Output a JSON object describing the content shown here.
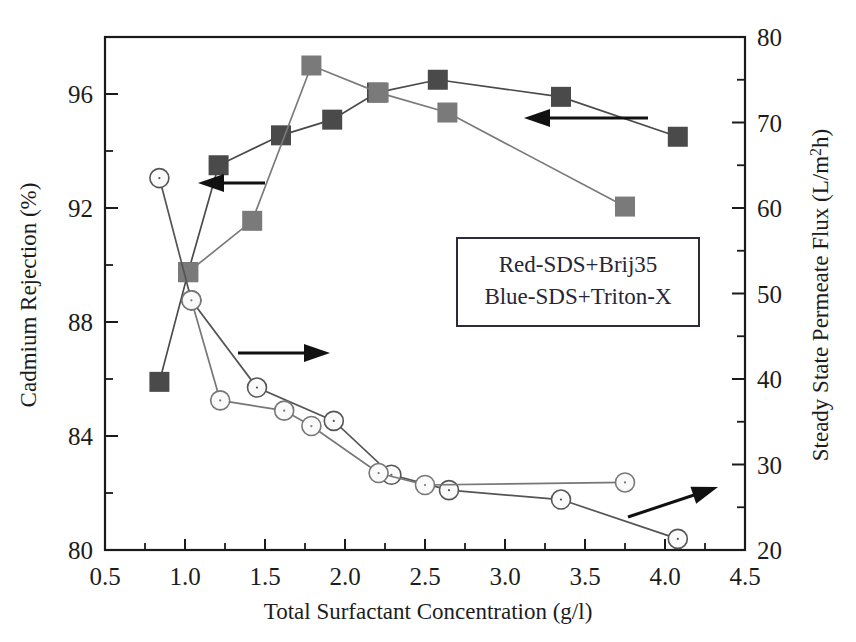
{
  "chart_data": {
    "type": "line",
    "title": "",
    "xlabel": "Total Surfactant Concentration (g/l)",
    "ylabel": "Cadmium Rejection (%)",
    "ylabel_right": "Steady State Permeate Flux (L/m²h)",
    "xlim": [
      0.5,
      4.5
    ],
    "ylim": [
      80,
      98
    ],
    "ylim_right": [
      20,
      80
    ],
    "xticks": [
      "0.5",
      "1.0",
      "1.5",
      "2.0",
      "2.5",
      "3.0",
      "3.5",
      "4.0",
      "4.5"
    ],
    "xtick_values": [
      0.5,
      1.0,
      1.5,
      2.0,
      2.5,
      3.0,
      3.5,
      4.0,
      4.5
    ],
    "yticks": [
      "80",
      "84",
      "88",
      "92",
      "96"
    ],
    "ytick_values": [
      80,
      84,
      88,
      92,
      96
    ],
    "yticks_right": [
      "20",
      "30",
      "40",
      "50",
      "60",
      "70",
      "80"
    ],
    "ytick_right_values": [
      20,
      30,
      40,
      50,
      60,
      70,
      80
    ],
    "grid": false,
    "legend_position": "center-right",
    "legend_entries": [
      "Red-SDS+Brij35",
      "Blue-SDS+Triton-X"
    ],
    "colors": {
      "red_series": "#555555",
      "blue_series": "#777777",
      "marker_square_dark": "#4a4a4a",
      "marker_square_light": "#7a7a7a",
      "marker_circle_fill": "#fafafa",
      "axis": "#1a1a1a",
      "legend_border": "#2b2b3a"
    },
    "series": [
      {
        "name": "Red-SDS+Brij35 rejection",
        "axis": "left",
        "marker": "square",
        "color": "#4a4a4a",
        "x": [
          0.84,
          1.02,
          1.21,
          1.6,
          1.92,
          2.2,
          2.58,
          3.35,
          4.08
        ],
        "y": [
          85.9,
          89.75,
          93.5,
          94.55,
          95.1,
          96.05,
          96.5,
          95.9,
          94.5
        ]
      },
      {
        "name": "Blue-SDS+Triton-X rejection",
        "axis": "left",
        "marker": "square",
        "color": "#7a7a7a",
        "x": [
          1.02,
          1.42,
          1.79,
          2.21,
          2.64,
          3.75
        ],
        "y": [
          89.75,
          91.55,
          97.0,
          96.05,
          95.35,
          92.05
        ]
      },
      {
        "name": "Red-SDS+Brij35 flux",
        "axis": "right",
        "marker": "circle",
        "color": "#555555",
        "x": [
          0.84,
          1.04,
          1.45,
          1.93,
          2.29,
          2.65,
          3.35,
          4.08
        ],
        "y": [
          63.5,
          49.2,
          39.0,
          35.1,
          28.8,
          27.0,
          25.9,
          21.3
        ]
      },
      {
        "name": "Blue-SDS+Triton-X flux",
        "axis": "right",
        "marker": "circle",
        "color": "#777777",
        "x": [
          1.04,
          1.22,
          1.62,
          1.79,
          2.21,
          2.5,
          3.75
        ],
        "y": [
          49.2,
          37.5,
          36.3,
          34.5,
          29.0,
          27.6,
          27.9
        ]
      }
    ],
    "annotations": [
      {
        "name": "arrow-left-rejection-lower",
        "direction": "left",
        "from_x": 265,
        "from_y": 183,
        "to_x": 198,
        "to_y": 183
      },
      {
        "name": "arrow-left-rejection-upper",
        "direction": "left",
        "from_x": 648,
        "from_y": 118,
        "to_x": 524,
        "to_y": 118
      },
      {
        "name": "arrow-right-flux-left",
        "direction": "right",
        "from_x": 238,
        "from_y": 353,
        "to_x": 330,
        "to_y": 353
      },
      {
        "name": "arrow-right-flux-right",
        "direction": "diagonal-up-right",
        "from_x": 628,
        "from_y": 517,
        "to_x": 718,
        "to_y": 487
      }
    ]
  }
}
